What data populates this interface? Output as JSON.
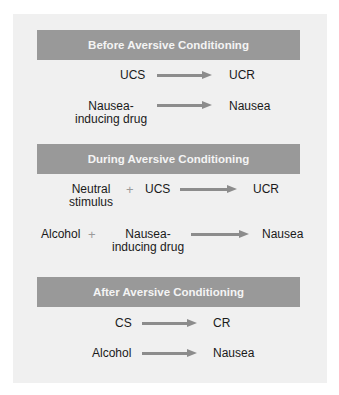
{
  "colors": {
    "panel_bg": "#f0f0f0",
    "header_bg": "#999999",
    "header_text": "#f4f4f4",
    "arrow": "#8c8c8c",
    "plus": "#9a9a9a"
  },
  "sections": [
    {
      "title": "Before Aversive Conditioning",
      "rows": [
        {
          "left": "UCS",
          "right": "UCR"
        },
        {
          "left": "Nausea-\ninducing drug",
          "right": "Nausea"
        }
      ]
    },
    {
      "title": "During Aversive Conditioning",
      "rows": [
        {
          "left_a": "Neutral\nstimulus",
          "plus": "+",
          "left_b": "UCS",
          "right": "UCR"
        },
        {
          "left_a": "Alcohol",
          "plus": "+",
          "left_b": "Nausea-\ninducing drug",
          "right": "Nausea"
        }
      ]
    },
    {
      "title": "After Aversive Conditioning",
      "rows": [
        {
          "left": "CS",
          "right": "CR"
        },
        {
          "left": "Alcohol",
          "right": "Nausea"
        }
      ]
    }
  ]
}
